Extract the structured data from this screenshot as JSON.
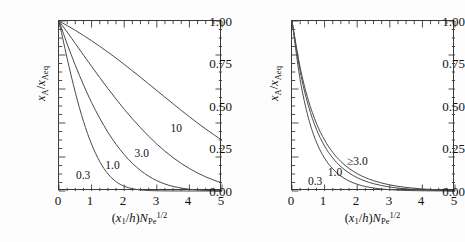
{
  "figure": {
    "background": "#ffffff",
    "axis_color": "#3a3a3a",
    "curve_color": "#4a4a4a"
  },
  "chart_data": [
    {
      "type": "line",
      "panel": "left",
      "title": "",
      "xlabel": "(x1/h)NPe^1/2",
      "ylabel": "xA/xAeq",
      "xlim": [
        0,
        5
      ],
      "ylim": [
        0,
        1
      ],
      "xticks": [
        "0",
        "1",
        "2",
        "3",
        "4",
        "5"
      ],
      "yticks": [
        "0.00",
        "0.25",
        "0.50",
        "0.75",
        "1.00"
      ],
      "grid": false,
      "legend_position": "inline-annotations",
      "x": [
        0,
        0.25,
        0.5,
        0.75,
        1,
        1.25,
        1.5,
        1.75,
        2,
        2.25,
        2.5,
        2.75,
        3,
        3.25,
        3.5,
        3.75,
        4,
        4.25,
        4.5,
        4.75,
        5
      ],
      "series": [
        {
          "name": "0.3",
          "label": "0.3",
          "label_x": 0.55,
          "label_y": 0.12,
          "values": [
            1.0,
            0.78,
            0.58,
            0.41,
            0.275,
            0.173,
            0.101,
            0.055,
            0.028,
            0.0135,
            0.006,
            0.0026,
            0.0011,
            0.0005,
            0.0002,
            0.0001,
            0.0,
            0.0,
            0.0,
            0.0,
            0.0
          ]
        },
        {
          "name": "1.0",
          "label": "1.0",
          "label_x": 1.45,
          "label_y": 0.175,
          "values": [
            1.0,
            0.865,
            0.74,
            0.625,
            0.52,
            0.428,
            0.346,
            0.275,
            0.214,
            0.163,
            0.121,
            0.087,
            0.061,
            0.041,
            0.027,
            0.017,
            0.0105,
            0.0062,
            0.0035,
            0.0019,
            0.001
          ]
        },
        {
          "name": "3.0",
          "label": "3.0",
          "label_x": 2.35,
          "label_y": 0.245,
          "values": [
            1.0,
            0.935,
            0.868,
            0.8,
            0.733,
            0.667,
            0.603,
            0.541,
            0.481,
            0.425,
            0.372,
            0.322,
            0.276,
            0.234,
            0.196,
            0.162,
            0.132,
            0.106,
            0.083,
            0.064,
            0.048
          ]
        },
        {
          "name": "10",
          "label": "10",
          "label_x": 3.45,
          "label_y": 0.395,
          "values": [
            1.0,
            0.973,
            0.945,
            0.915,
            0.884,
            0.851,
            0.817,
            0.782,
            0.745,
            0.707,
            0.669,
            0.63,
            0.591,
            0.552,
            0.513,
            0.474,
            0.437,
            0.4,
            0.365,
            0.331,
            0.299
          ]
        }
      ]
    },
    {
      "type": "line",
      "panel": "right",
      "title": "",
      "xlabel": "(x1/h)NPe^1/2",
      "ylabel": "xA/xAeq",
      "xlim": [
        0,
        5
      ],
      "ylim": [
        0,
        1
      ],
      "xticks": [
        "0",
        "1",
        "2",
        "3",
        "4",
        "5"
      ],
      "yticks": [
        "0.00",
        "0.25",
        "0.50",
        "0.75",
        "1.00"
      ],
      "grid": false,
      "legend_position": "inline-annotations",
      "x": [
        0,
        0.25,
        0.5,
        0.75,
        1,
        1.25,
        1.5,
        1.75,
        2,
        2.25,
        2.5,
        2.75,
        3,
        3.25,
        3.5,
        3.75,
        4,
        4.25,
        4.5,
        4.75,
        5
      ],
      "series": [
        {
          "name": "0.3",
          "label": "0.3",
          "label_x": 0.52,
          "label_y": 0.085,
          "values": [
            1.0,
            0.655,
            0.432,
            0.287,
            0.193,
            0.13,
            0.0875,
            0.059,
            0.0395,
            0.0265,
            0.0177,
            0.0118,
            0.0078,
            0.0051,
            0.0033,
            0.0021,
            0.0013,
            0.0008,
            0.0005,
            0.0003,
            0.0002
          ]
        },
        {
          "name": "1.0",
          "label": "1.0",
          "label_x": 1.13,
          "label_y": 0.135,
          "values": [
            1.0,
            0.705,
            0.503,
            0.363,
            0.264,
            0.194,
            0.143,
            0.106,
            0.0785,
            0.0583,
            0.0432,
            0.0319,
            0.0235,
            0.0172,
            0.0125,
            0.0091,
            0.0065,
            0.0047,
            0.0033,
            0.0023,
            0.0016
          ]
        },
        {
          "name": "≥3.0",
          "label": "≥3.0",
          "label_x": 1.72,
          "label_y": 0.2,
          "values": [
            1.0,
            0.727,
            0.535,
            0.398,
            0.299,
            0.227,
            0.173,
            0.133,
            0.102,
            0.0787,
            0.0607,
            0.0468,
            0.036,
            0.0276,
            0.0211,
            0.0161,
            0.0122,
            0.0092,
            0.0069,
            0.0051,
            0.0038
          ]
        }
      ]
    }
  ]
}
